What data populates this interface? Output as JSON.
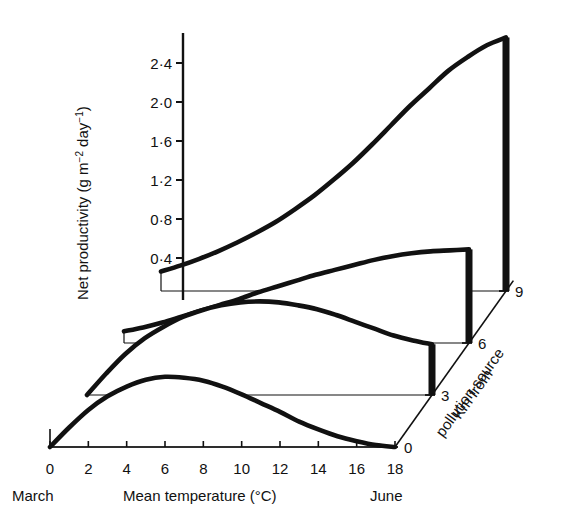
{
  "chart_data": {
    "type": "line",
    "title": "",
    "xlabel": "Mean temperature (°C)",
    "ylabel": "Net productivity (g m⁻² day⁻¹)",
    "zlabel": "Km from pollution source",
    "xlim": [
      0,
      18
    ],
    "ylim": [
      0,
      2.6
    ],
    "zlim": [
      0,
      9
    ],
    "x_ticks": [
      "0",
      "2",
      "4",
      "6",
      "8",
      "10",
      "12",
      "14",
      "16",
      "18"
    ],
    "x_tick_values": [
      0,
      2,
      4,
      6,
      8,
      10,
      12,
      14,
      16,
      18
    ],
    "y_ticks": [
      "0·4",
      "0·8",
      "1·2",
      "1·6",
      "2·0",
      "2·4"
    ],
    "y_tick_values": [
      0.4,
      0.8,
      1.2,
      1.6,
      2.0,
      2.4
    ],
    "z_ticks": [
      "0",
      "3",
      "6",
      "9"
    ],
    "z_tick_values": [
      0,
      3,
      6,
      9
    ],
    "x_start_annotation": "March",
    "x_end_annotation": "June",
    "grid": false,
    "legend": "none",
    "series": [
      {
        "name": "0 km from pollution source",
        "z": 0,
        "x": [
          0,
          1,
          2,
          3,
          4,
          5,
          6,
          7,
          8,
          9,
          10,
          11,
          12,
          13,
          14,
          15,
          16,
          17,
          18
        ],
        "values": [
          0.0,
          0.2,
          0.38,
          0.52,
          0.62,
          0.69,
          0.72,
          0.71,
          0.68,
          0.62,
          0.54,
          0.45,
          0.36,
          0.26,
          0.18,
          0.11,
          0.06,
          0.02,
          0.0
        ]
      },
      {
        "name": "3 km from pollution source",
        "z": 3,
        "x": [
          0,
          1,
          2,
          3,
          4,
          5,
          6,
          7,
          8,
          9,
          10,
          11,
          12,
          13,
          14,
          15,
          16,
          17,
          18
        ],
        "values": [
          0.0,
          0.22,
          0.42,
          0.58,
          0.7,
          0.8,
          0.87,
          0.92,
          0.95,
          0.96,
          0.95,
          0.92,
          0.88,
          0.82,
          0.75,
          0.68,
          0.61,
          0.56,
          0.52
        ]
      },
      {
        "name": "6 km from pollution source",
        "z": 6,
        "x": [
          0,
          1,
          2,
          3,
          4,
          5,
          6,
          7,
          8,
          9,
          10,
          11,
          12,
          13,
          14,
          15,
          16,
          17,
          18
        ],
        "values": [
          0.12,
          0.16,
          0.21,
          0.27,
          0.33,
          0.39,
          0.45,
          0.52,
          0.58,
          0.64,
          0.7,
          0.75,
          0.8,
          0.85,
          0.89,
          0.92,
          0.94,
          0.95,
          0.96
        ]
      },
      {
        "name": "9 km from pollution source",
        "z": 9,
        "x": [
          0,
          1,
          2,
          3,
          4,
          5,
          6,
          7,
          8,
          9,
          10,
          11,
          12,
          13,
          14,
          15,
          16,
          17,
          18
        ],
        "values": [
          0.2,
          0.26,
          0.33,
          0.41,
          0.5,
          0.6,
          0.71,
          0.84,
          0.98,
          1.14,
          1.31,
          1.5,
          1.7,
          1.9,
          2.08,
          2.26,
          2.4,
          2.52,
          2.6
        ]
      }
    ]
  },
  "axes": {
    "y_title_main": "Net productivity (g m",
    "y_title_sup1": "−2",
    "y_title_mid": " day",
    "y_title_sup2": "−1",
    "y_title_end": ")",
    "x_title": "Mean temperature (°C)",
    "z_title_line1": "Km from",
    "z_title_line2": "pollution source",
    "march_label": "March",
    "june_label": "June"
  },
  "style": {
    "ink": "#111111",
    "ribbon_fill": "#ffffff",
    "background": "#ffffff"
  }
}
